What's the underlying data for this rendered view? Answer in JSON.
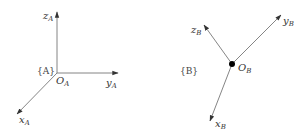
{
  "diagram": {
    "colors": {
      "axis": "#555555",
      "text": "#333333",
      "origin_dot": "#000000"
    },
    "frame_a": {
      "label": "{A}",
      "origin": {
        "main": "O",
        "sub": "A"
      },
      "axes": {
        "z": {
          "main": "z",
          "sub": "A"
        },
        "y": {
          "main": "y",
          "sub": "A"
        },
        "x": {
          "main": "x",
          "sub": "A"
        }
      }
    },
    "frame_b": {
      "label": "{B}",
      "origin": {
        "main": "O",
        "sub": "B"
      },
      "axes": {
        "z": {
          "main": "z",
          "sub": "B"
        },
        "y": {
          "main": "y",
          "sub": "B"
        },
        "x": {
          "main": "x",
          "sub": "B"
        }
      }
    }
  }
}
